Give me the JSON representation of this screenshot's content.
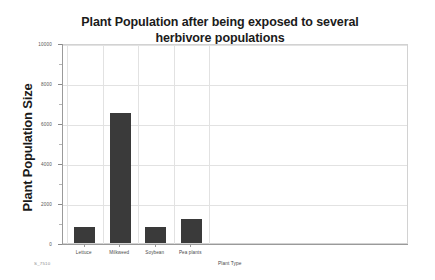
{
  "chart_data": {
    "type": "bar",
    "title": "Plant Population after being exposed to several herbivore populations",
    "title_line1": "Plant Population after being exposed to several",
    "title_line2": "herbivore populations",
    "xlabel": "Plant Type",
    "ylabel": "Plant Population Size",
    "categories": [
      "Lettuce",
      "Milkweed",
      "Soybean",
      "Pea plants"
    ],
    "values": [
      800,
      6500,
      800,
      1200
    ],
    "ylim": [
      0,
      10000
    ],
    "ytick_labels": [
      "0",
      "2000",
      "4000",
      "6000",
      "8000",
      "10000"
    ],
    "ytick_values": [
      0,
      2000,
      4000,
      6000,
      8000,
      10000
    ],
    "grid": true,
    "legend": false,
    "bar_color": "#3a3a3a",
    "grid_color": "#e2e2e2",
    "axis_color": "#9a9a9a",
    "text_color": "#1b1b1b"
  },
  "watermark": {
    "text": "S_7510"
  }
}
